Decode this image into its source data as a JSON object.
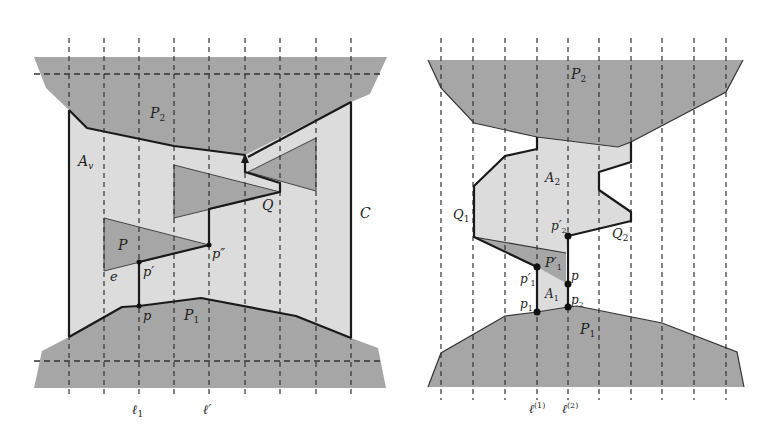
{
  "figure": {
    "colors": {
      "obstacle_dark": "#a6a6a6",
      "region_light": "#dcdcdc",
      "background": "#ffffff",
      "stroke": "#1a1a1a"
    },
    "left_panel": {
      "labels": {
        "P2": "P",
        "P2_sub": "2",
        "P1": "P",
        "P1_sub": "1",
        "Av": "A",
        "Av_sub": "v",
        "P": "P",
        "Q": "Q",
        "C": "C",
        "e": "e",
        "p": "p",
        "p_prime": "p′",
        "p_double_prime": "p″",
        "l1": "ℓ",
        "l1_sub": "1",
        "l_prime": "ℓ′"
      }
    },
    "right_panel": {
      "labels": {
        "P2": "P",
        "P2_sub": "2",
        "P1": "P",
        "P1_sub": "1",
        "A2": "A",
        "A2_sub": "2",
        "A1": "A",
        "A1_sub": "1",
        "Q1": "Q",
        "Q1_sub": "1",
        "Q2": "Q",
        "Q2_sub": "2",
        "P1_prime": "P′",
        "P1_prime_sub": "1",
        "p": "p",
        "p1": "p",
        "p1_sub": "1",
        "p2": "p",
        "p2_sub": "2",
        "p1_prime": "p′",
        "p1_prime_sub": "1",
        "p2_prime": "p′",
        "p2_prime_sub": "2",
        "l1": "ℓ",
        "l1_sup": "(1)",
        "l2": "ℓ",
        "l2_sup": "(2)"
      }
    }
  }
}
